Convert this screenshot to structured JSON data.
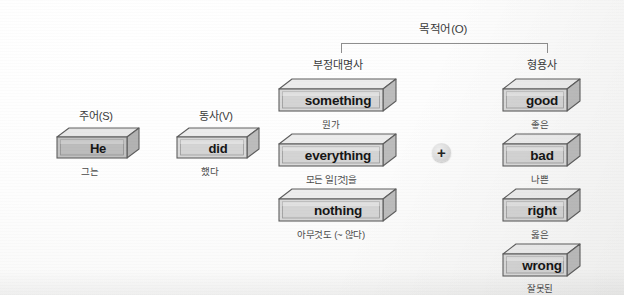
{
  "diagram": {
    "title_group": {
      "label": "목적어(O)"
    },
    "columns": [
      {
        "id": "subject",
        "category": "주어(S)",
        "blocks": [
          {
            "word": "He",
            "gloss": "그는",
            "shade": "dark"
          }
        ]
      },
      {
        "id": "verb",
        "category": "동사(V)",
        "blocks": [
          {
            "word": "did",
            "gloss": "했다",
            "shade": "light"
          }
        ]
      },
      {
        "id": "indefinite-pronoun",
        "category": "부정대명사",
        "blocks": [
          {
            "word": "something",
            "gloss": "뭔가",
            "shade": "light"
          },
          {
            "word": "everything",
            "gloss": "모든 일[것]을",
            "shade": "light"
          },
          {
            "word": "nothing",
            "gloss": "아무것도 (~ 않다)",
            "shade": "light"
          }
        ]
      },
      {
        "id": "adjective",
        "category": "형용사",
        "blocks": [
          {
            "word": "good",
            "gloss": "좋은",
            "shade": "light"
          },
          {
            "word": "bad",
            "gloss": "나쁜",
            "shade": "light"
          },
          {
            "word": "right",
            "gloss": "옳은",
            "shade": "light"
          },
          {
            "word": "wrong",
            "gloss": "잘못된",
            "shade": "light"
          }
        ]
      }
    ],
    "operator": {
      "symbol": "+"
    },
    "colors": {
      "background": "#fdfdfd",
      "block_face": "#d9d9d9",
      "block_top": "#e9e9e9",
      "block_side": "#b9b9b9",
      "block_face_dark": "#bdbdbd",
      "outline": "#5e5e5e",
      "text": "#161616",
      "bracket": "#8e8e8e"
    }
  }
}
